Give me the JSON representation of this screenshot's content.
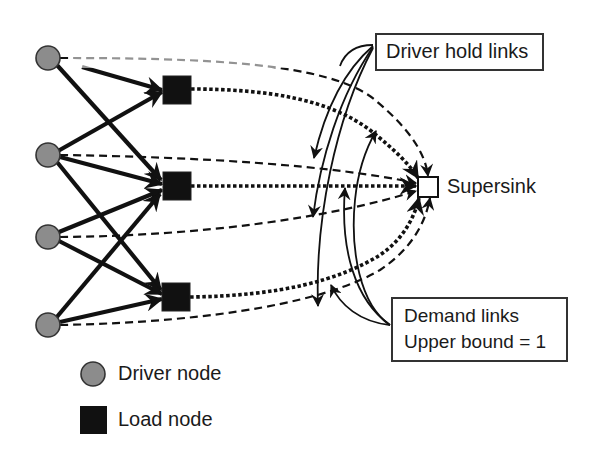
{
  "diagram": {
    "type": "network flow diagram",
    "colors": {
      "driver_node_fill": "#8c8c8c",
      "load_node_fill": "#111111",
      "supersink_fill": "#ffffff",
      "line": "#111111"
    },
    "nodes": {
      "drivers": [
        {
          "id": "d1",
          "x": 48,
          "y": 58
        },
        {
          "id": "d2",
          "x": 48,
          "y": 155
        },
        {
          "id": "d3",
          "x": 48,
          "y": 237
        },
        {
          "id": "d4",
          "x": 48,
          "y": 325
        }
      ],
      "loads": [
        {
          "id": "l1",
          "x": 177,
          "y": 90
        },
        {
          "id": "l2",
          "x": 177,
          "y": 186
        },
        {
          "id": "l3",
          "x": 176,
          "y": 297
        }
      ],
      "supersink": {
        "id": "s",
        "x": 428,
        "y": 187,
        "label": "Supersink"
      }
    },
    "edges": {
      "driver_to_load": [
        [
          "d1",
          "l1"
        ],
        [
          "d1",
          "l2"
        ],
        [
          "d2",
          "l1"
        ],
        [
          "d2",
          "l2"
        ],
        [
          "d2",
          "l3"
        ],
        [
          "d3",
          "l2"
        ],
        [
          "d3",
          "l3"
        ],
        [
          "d4",
          "l2"
        ],
        [
          "d4",
          "l3"
        ]
      ],
      "driver_hold_links": [
        "d1",
        "d2",
        "d3",
        "d4"
      ],
      "demand_links": [
        "l1",
        "l2",
        "l3"
      ]
    },
    "callouts": {
      "driver_hold": "Driver hold links",
      "demand_line1": "Demand links",
      "demand_line2": "Upper bound = 1"
    },
    "legend": {
      "driver": "Driver node",
      "load": "Load node"
    }
  }
}
